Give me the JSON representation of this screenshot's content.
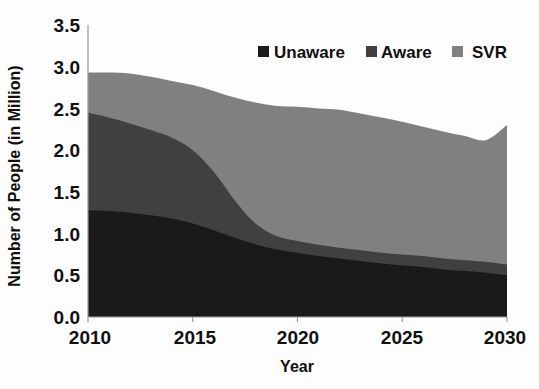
{
  "chart_data": {
    "type": "area",
    "stacked": true,
    "title": "",
    "subtitle": "",
    "xlabel": "Year",
    "ylabel": "Number of People (in Million)",
    "xlim": [
      2010,
      2030
    ],
    "ylim": [
      0.0,
      3.5
    ],
    "grid": false,
    "legend_position": "top-right",
    "x": [
      2010,
      2011,
      2012,
      2013,
      2014,
      2015,
      2016,
      2017,
      2018,
      2019,
      2020,
      2021,
      2022,
      2023,
      2024,
      2025,
      2026,
      2027,
      2028,
      2029,
      2030
    ],
    "xtick_labels": [
      "2010",
      "2015",
      "2020",
      "2025",
      "2030"
    ],
    "xtick_values": [
      2010,
      2015,
      2020,
      2025,
      2030
    ],
    "ytick_labels": [
      "0.0",
      "0.5",
      "1.0",
      "1.5",
      "2.0",
      "2.5",
      "3.0",
      "3.5"
    ],
    "ytick_values": [
      0.0,
      0.5,
      1.0,
      1.5,
      2.0,
      2.5,
      3.0,
      3.5
    ],
    "series": [
      {
        "name": "Unaware",
        "color": "#1a1a1a",
        "values": [
          1.28,
          1.27,
          1.25,
          1.22,
          1.18,
          1.12,
          1.04,
          0.95,
          0.87,
          0.81,
          0.77,
          0.73,
          0.7,
          0.67,
          0.64,
          0.62,
          0.6,
          0.57,
          0.55,
          0.53,
          0.5
        ]
      },
      {
        "name": "Aware",
        "color": "#404040",
        "values": [
          1.17,
          1.12,
          1.07,
          1.02,
          0.97,
          0.88,
          0.7,
          0.45,
          0.25,
          0.16,
          0.14,
          0.135,
          0.13,
          0.13,
          0.13,
          0.13,
          0.13,
          0.13,
          0.13,
          0.13,
          0.13
        ]
      },
      {
        "name": "SVR",
        "color": "#808080",
        "values": [
          0.48,
          0.54,
          0.6,
          0.64,
          0.68,
          0.78,
          0.97,
          1.23,
          1.45,
          1.56,
          1.61,
          1.635,
          1.655,
          1.64,
          1.62,
          1.59,
          1.55,
          1.52,
          1.49,
          1.46,
          1.67
        ]
      }
    ],
    "stack_tops": {
      "unaware": [
        1.28,
        1.27,
        1.25,
        1.22,
        1.18,
        1.12,
        1.04,
        0.95,
        0.87,
        0.81,
        0.77,
        0.73,
        0.7,
        0.67,
        0.64,
        0.62,
        0.6,
        0.57,
        0.55,
        0.53,
        0.5
      ],
      "aware": [
        2.45,
        2.39,
        2.32,
        2.24,
        2.15,
        2.0,
        1.74,
        1.4,
        1.12,
        0.97,
        0.91,
        0.865,
        0.83,
        0.8,
        0.77,
        0.75,
        0.73,
        0.7,
        0.68,
        0.66,
        0.63
      ],
      "svr": [
        2.93,
        2.93,
        2.92,
        2.88,
        2.83,
        2.78,
        2.71,
        2.63,
        2.57,
        2.53,
        2.52,
        2.5,
        2.485,
        2.44,
        2.39,
        2.34,
        2.28,
        2.22,
        2.17,
        2.12,
        2.3
      ]
    }
  },
  "legend": {
    "items": [
      {
        "label": "Unaware",
        "color": "#1a1a1a"
      },
      {
        "label": "Aware",
        "color": "#404040"
      },
      {
        "label": "SVR",
        "color": "#808080"
      }
    ]
  },
  "axes": {
    "x_title": "Year",
    "y_title": "Number of People (in Million)",
    "x_ticks": [
      "2010",
      "2015",
      "2020",
      "2025",
      "2030"
    ],
    "y_ticks": [
      "3.5",
      "3.0",
      "2.5",
      "2.0",
      "1.5",
      "1.0",
      "0.5",
      "0.0"
    ]
  }
}
